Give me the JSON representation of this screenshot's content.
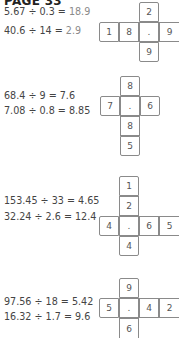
{
  "page": {
    "title": "PAGE 33"
  },
  "sections": [
    {
      "equations": [
        {
          "expr": "5.67 ÷ 0.3 = ",
          "result": "18.9"
        },
        {
          "expr": "40.6 ÷ 14 = ",
          "result": "2.9"
        }
      ],
      "grid": {
        "row": [
          "1",
          "8",
          ".",
          "9"
        ],
        "column_above": [
          "2"
        ],
        "column_below": [
          "9"
        ]
      }
    },
    {
      "equations": [
        {
          "expr": "68.4 ÷ 9 = ",
          "result": "7.6"
        },
        {
          "expr": "7.08 ÷ 0.8 = ",
          "result": "8.85"
        }
      ],
      "grid": {
        "row": [
          "7",
          ".",
          "6"
        ],
        "column_above": [
          "8"
        ],
        "column_below": [
          "8",
          "5"
        ]
      }
    },
    {
      "equations": [
        {
          "expr": "153.45 ÷ 33 = ",
          "result": "4.65"
        },
        {
          "expr": "32.24 ÷ 2.6 = ",
          "result": "12.4"
        }
      ],
      "grid": {
        "row": [
          "4",
          ".",
          "6",
          "5"
        ],
        "column_above": [
          "1",
          "2"
        ],
        "column_below": [
          "4"
        ]
      }
    },
    {
      "equations": [
        {
          "expr": "97.56 ÷ 18 = ",
          "result": "5.42"
        },
        {
          "expr": "16.32 ÷ 1.7 = ",
          "result": "9.6"
        }
      ],
      "grid": {
        "row": [
          "5",
          ".",
          "4",
          "2"
        ],
        "column_above": [
          "9"
        ],
        "column_below": [
          "6"
        ]
      }
    }
  ]
}
